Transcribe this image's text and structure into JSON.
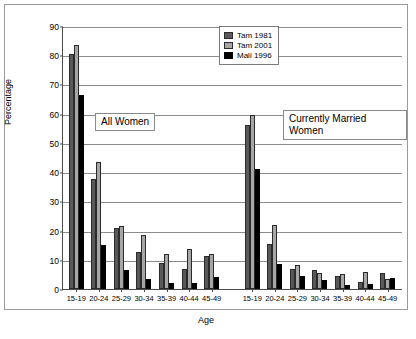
{
  "chart_data": {
    "type": "bar",
    "title": "",
    "xlabel": "Age",
    "ylabel": "Percentage",
    "ylim": [
      0,
      90
    ],
    "ytick_step": 10,
    "yticks": [
      "0",
      "10",
      "20",
      "30",
      "40",
      "50",
      "60",
      "70",
      "80",
      "90"
    ],
    "grid": true,
    "legend_position": "top-right",
    "series_names": [
      "Tam 1981",
      "Tam 2001",
      "Mali 1996"
    ],
    "series_colors": [
      "#595959",
      "#a6a6a6",
      "#000000"
    ],
    "categories": [
      "15-19",
      "20-24",
      "25-29",
      "30-34",
      "35-39",
      "40-44",
      "45-49"
    ],
    "panels": [
      {
        "name": "All Women",
        "categories": [
          "15-19",
          "20-24",
          "25-29",
          "30-34",
          "35-39",
          "40-44",
          "45-49"
        ],
        "series": [
          {
            "name": "Tam 1981",
            "values": [
              80.5,
              37.5,
              21.0,
              12.5,
              9.0,
              7.0,
              11.3
            ]
          },
          {
            "name": "Tam 2001",
            "values": [
              83.5,
              43.5,
              21.5,
              18.5,
              12.0,
              13.7,
              12.0
            ]
          },
          {
            "name": "Mali 1996",
            "values": [
              66.5,
              15.0,
              6.5,
              3.5,
              2.0,
              2.2,
              4.0
            ]
          }
        ]
      },
      {
        "name": "Currently Married Women",
        "categories": [
          "15-19",
          "20-24",
          "25-29",
          "30-34",
          "35-39",
          "40-44",
          "45-49"
        ],
        "series": [
          {
            "name": "Tam 1981",
            "values": [
              56.0,
              15.5,
              7.0,
              6.5,
              4.4,
              2.3,
              5.4
            ]
          },
          {
            "name": "Tam 2001",
            "values": [
              59.5,
              21.8,
              8.3,
              5.6,
              5.0,
              5.7,
              3.5
            ]
          },
          {
            "name": "Mali 1996",
            "values": [
              41.0,
              8.5,
              4.5,
              3.0,
              1.4,
              1.6,
              3.7
            ]
          }
        ]
      }
    ],
    "annotations": [
      {
        "text": "All Women"
      },
      {
        "text": "Currently Married Women"
      }
    ]
  },
  "legend": {
    "items": [
      {
        "label": "Tam 1981",
        "color": "#595959"
      },
      {
        "label": "Tam 2001",
        "color": "#a6a6a6"
      },
      {
        "label": "Mali 1996",
        "color": "#000000"
      }
    ]
  },
  "axes": {
    "y_title": "Percentage",
    "x_title": "Age"
  }
}
